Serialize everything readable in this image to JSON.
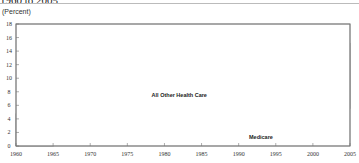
{
  "header": {
    "title_fragment": "1960 to 2005",
    "unit_label": "(Percent)"
  },
  "chart_data": {
    "type": "area",
    "stacked": true,
    "title": "1960 to 2005",
    "xlabel": "",
    "ylabel": "(Percent)",
    "xlim": [
      1960,
      2005
    ],
    "ylim": [
      0,
      18
    ],
    "x_ticks": [
      1960,
      1965,
      1970,
      1975,
      1980,
      1985,
      1990,
      1995,
      2000,
      2005
    ],
    "y_ticks": [
      0,
      2,
      4,
      6,
      8,
      10,
      12,
      14,
      16,
      18
    ],
    "grid": false,
    "legend": "inline labels",
    "x": [
      1960,
      1965,
      1966,
      1967,
      1970,
      1975,
      1980,
      1983,
      1985,
      1990,
      1993,
      1995,
      2000,
      2002,
      2005
    ],
    "series": [
      {
        "name": "Medicare",
        "color": "#b3b3b3",
        "values": [
          0,
          0,
          0.3,
          0.6,
          0.7,
          1.1,
          1.4,
          1.7,
          1.8,
          1.9,
          2.4,
          2.5,
          2.3,
          2.5,
          2.8
        ]
      },
      {
        "name": "Medicaid",
        "color": "#555555",
        "values": [
          0,
          0,
          0.2,
          0.5,
          0.7,
          1.0,
          1.1,
          1.2,
          1.2,
          1.6,
          1.9,
          2.0,
          2.2,
          2.3,
          2.7
        ]
      },
      {
        "name": "All Other Health Care",
        "color": "#ececec",
        "values": [
          4.8,
          5.2,
          5.3,
          5.1,
          5.2,
          5.4,
          5.8,
          6.9,
          6.9,
          8.5,
          8.8,
          8.7,
          8.6,
          10.0,
          9.7
        ]
      }
    ],
    "total": [
      4.8,
      5.2,
      5.8,
      6.2,
      6.6,
      7.5,
      8.3,
      9.8,
      9.9,
      12.0,
      13.1,
      13.2,
      13.1,
      14.8,
      15.2
    ],
    "annotations": [
      {
        "text": "All Other Health Care",
        "x": 1982,
        "y": 7.2
      },
      {
        "text": "Medicaid",
        "x": 2002,
        "y": 3.6
      },
      {
        "text": "Medicare",
        "x": 1993,
        "y": 1.0
      }
    ]
  },
  "colors": {
    "medicare": "#b3b3b3",
    "medicaid": "#555555",
    "all_other": "#ececec",
    "outline": "#777777"
  }
}
